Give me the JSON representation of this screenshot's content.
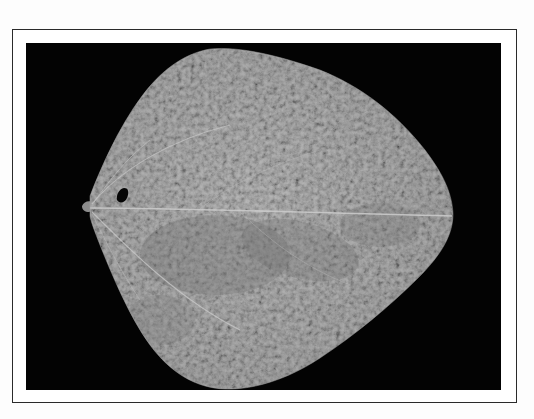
{
  "image": {
    "description": "Grayscale photograph of a single broad, heart-shaped leaf with mottled texture on a black background, enclosed in a thin rectangular frame",
    "subject": "leaf",
    "features": [
      "petiole",
      "midrib",
      "lateral-veins",
      "small-hole-near-base",
      "mottled-surface"
    ],
    "colors": {
      "page_background": "#fdfdfd",
      "frame_border": "#2a2a2a",
      "photo_background": "#030303",
      "leaf_light": "#bdbdbd",
      "leaf_mid": "#9c9c9c",
      "leaf_dark": "#7e7e7e",
      "vein": "#d2d2d2",
      "hole": "#050505"
    }
  }
}
